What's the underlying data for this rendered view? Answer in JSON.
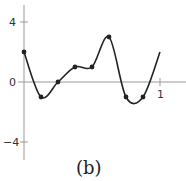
{
  "chart_data": {
    "type": "line",
    "title": "",
    "caption": "(b)",
    "xlabel": "",
    "ylabel": "",
    "xlim": [
      0,
      1
    ],
    "ylim": [
      -4,
      4
    ],
    "grid": false,
    "x_ticks": [
      "1"
    ],
    "y_ticks": [
      "4",
      "0",
      "−4"
    ],
    "points": {
      "x": [
        0,
        0.125,
        0.25,
        0.375,
        0.5,
        0.625,
        0.75,
        0.875
      ],
      "y": [
        2,
        -1,
        0,
        1,
        1,
        3,
        -1,
        -1
      ]
    },
    "series": [
      {
        "name": "interpolating curve",
        "style": "smooth line through marked points"
      }
    ]
  },
  "labels": {
    "y_top": "4",
    "y_zero": "0",
    "y_bottom": "−4",
    "x_one": "1",
    "caption": "(b)"
  }
}
